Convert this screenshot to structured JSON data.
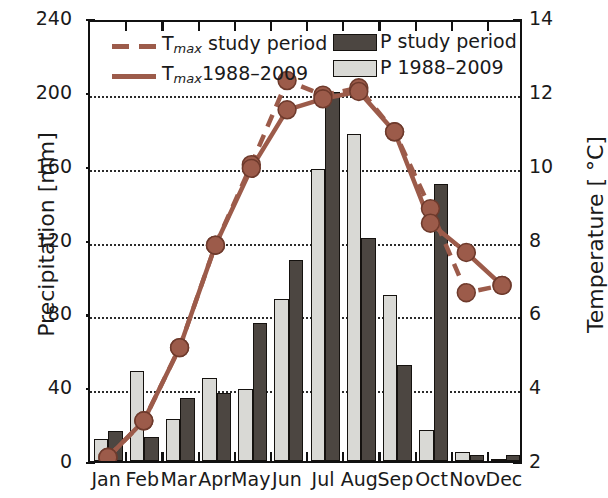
{
  "chart_data": {
    "type": "bar",
    "title": "",
    "xlabel": "",
    "ylabel": "Precipitation [mm]",
    "y2label": "Temperature [ °C]",
    "categories": [
      "Jan",
      "Feb",
      "Mar",
      "Apr",
      "May",
      "Jun",
      "Jul",
      "Aug",
      "Sep",
      "Oct",
      "Nov",
      "Dec"
    ],
    "ylim": [
      0,
      240
    ],
    "y2lim": [
      2,
      14
    ],
    "yticks": [
      0,
      40,
      80,
      120,
      160,
      200,
      240
    ],
    "y2ticks": [
      2,
      4,
      6,
      8,
      10,
      12,
      14
    ],
    "grid": true,
    "legend_position": "top",
    "series": [
      {
        "name": "P 1988-2009",
        "kind": "bar",
        "color": "#d9d9d5",
        "axis": "left",
        "values": [
          12,
          49,
          23,
          45,
          39,
          88,
          158,
          177,
          90,
          17,
          5,
          1
        ]
      },
      {
        "name": "P study period",
        "kind": "bar",
        "color": "#4c4641",
        "axis": "left",
        "values": [
          16,
          13,
          34,
          37,
          75,
          109,
          200,
          121,
          52,
          150,
          3,
          3
        ]
      },
      {
        "name": "T_max study period",
        "kind": "line-dashed",
        "color": "#9c5b4a",
        "axis": "right",
        "values": [
          2.1,
          3.1,
          5.1,
          7.9,
          10.1,
          12.4,
          12.0,
          12.2,
          11.0,
          8.9,
          6.6,
          6.8
        ]
      },
      {
        "name": "T_max 1988-2009",
        "kind": "line-solid",
        "color": "#9c5b4a",
        "axis": "right",
        "values": [
          2.1,
          3.1,
          5.1,
          7.9,
          10.0,
          11.6,
          11.9,
          12.1,
          11.0,
          8.5,
          7.7,
          6.8
        ]
      }
    ]
  },
  "legend": {
    "entries": [
      {
        "label_main": "T",
        "label_sub": "max",
        "label_tail": " study period",
        "style": "dashed-line",
        "color": "#9c5b4a"
      },
      {
        "label_main": "T",
        "label_sub": "max",
        "label_tail": "1988–2009",
        "style": "solid-line",
        "color": "#9c5b4a"
      },
      {
        "label_main": "P study period",
        "label_sub": "",
        "label_tail": "",
        "style": "dark-swatch",
        "color": "#4c4641"
      },
      {
        "label_main": "P 1988–2009",
        "label_sub": "",
        "label_tail": "",
        "style": "light-swatch",
        "color": "#d9d9d5"
      }
    ]
  },
  "axes": {
    "left_title": "Precipitation [mm]",
    "right_title": "Temperature [ °C]",
    "left_ticks": [
      "240",
      "200",
      "160",
      "120",
      "80",
      "40",
      "0"
    ],
    "right_ticks": [
      "14",
      "12",
      "10",
      "8",
      "6",
      "4",
      "2"
    ],
    "x_ticks": [
      "Jan",
      "Feb",
      "Mar",
      "Apr",
      "May",
      "Jun",
      "Jul",
      "Aug",
      "Sep",
      "Oct",
      "Nov",
      "Dec"
    ]
  }
}
